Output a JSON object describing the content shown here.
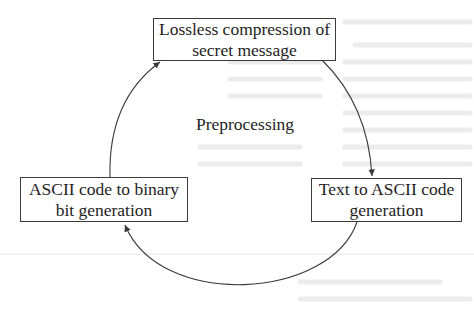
{
  "diagram": {
    "type": "cycle",
    "center_label": "Preprocessing",
    "nodes": [
      {
        "id": "compression",
        "lines": [
          "Lossless compression of",
          "secret message"
        ]
      },
      {
        "id": "text_to_ascii",
        "lines": [
          "Text to ASCII code",
          "generation"
        ]
      },
      {
        "id": "ascii_to_binary",
        "lines": [
          "ASCII code to binary",
          "bit generation"
        ]
      }
    ],
    "edges": [
      {
        "from": "compression",
        "to": "text_to_ascii"
      },
      {
        "from": "text_to_ascii",
        "to": "ascii_to_binary"
      },
      {
        "from": "ascii_to_binary",
        "to": "compression"
      }
    ],
    "colors": {
      "line": "#3a3a3a",
      "text": "#1e1e1e",
      "background": "#ffffff"
    }
  }
}
